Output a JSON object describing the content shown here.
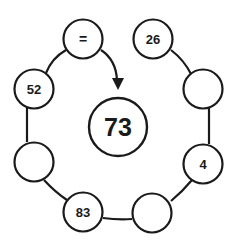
{
  "puzzle": {
    "center": {
      "label": "73"
    },
    "nodes": [
      {
        "id": "top-left",
        "label": "="
      },
      {
        "id": "top-right",
        "label": "26"
      },
      {
        "id": "upper-left",
        "label": "52"
      },
      {
        "id": "upper-right",
        "label": ""
      },
      {
        "id": "lower-left",
        "label": ""
      },
      {
        "id": "lower-right",
        "label": "4"
      },
      {
        "id": "bottom-left",
        "label": "83"
      },
      {
        "id": "bottom-right",
        "label": ""
      }
    ]
  },
  "colors": {
    "stroke": "#1a1a1a",
    "background": "#ffffff"
  }
}
